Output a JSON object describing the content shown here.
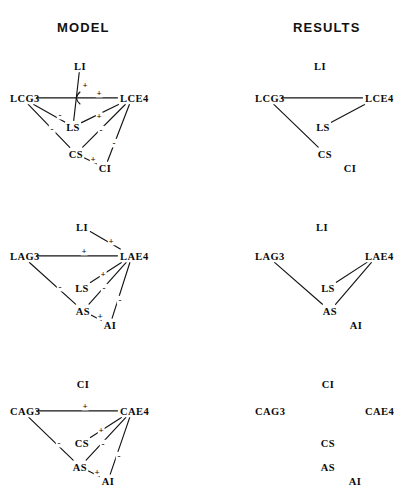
{
  "headings": {
    "left": "MODEL",
    "right": "RESULTS"
  },
  "style": {
    "line_color": "#141414",
    "text_color": "#0b0b0b",
    "background": "#ffffff"
  },
  "chart_data": {
    "type": "diagram",
    "subtype": "signed-digraph-panels",
    "title": "MODEL",
    "title2": "RESULTS",
    "columns": [
      "MODEL",
      "RESULTS"
    ],
    "rows": [
      "row-1-LC",
      "row-2-LA",
      "row-3-CA"
    ],
    "panels": [
      {
        "id": "model-row1",
        "column": "MODEL",
        "row": 1,
        "nodes": [
          {
            "id": "LI",
            "label": "LI",
            "x": 80,
            "y": 70,
            "anchor": "middle"
          },
          {
            "id": "LCG3",
            "label": "LCG3",
            "x": 10,
            "y": 102,
            "anchor": "start"
          },
          {
            "id": "LCE4",
            "label": "LCE4",
            "x": 120,
            "y": 102,
            "anchor": "start"
          },
          {
            "id": "LS",
            "label": "LS",
            "x": 73,
            "y": 131,
            "anchor": "middle"
          },
          {
            "id": "CS",
            "label": "CS",
            "x": 76,
            "y": 158,
            "anchor": "middle"
          },
          {
            "id": "CI",
            "label": "CI",
            "x": 105,
            "y": 172,
            "anchor": "middle"
          }
        ],
        "edges": [
          {
            "from": "LI",
            "to": "LS",
            "sign": "+",
            "sign_x": 85,
            "sign_y": 88
          },
          {
            "from": "LCG3",
            "to": "LCE4",
            "sign": "+",
            "sign_x": 99,
            "sign_y": 96
          },
          {
            "from": "LCG3",
            "to": "LS",
            "sign": "-",
            "sign_x": 60,
            "sign_y": 118
          },
          {
            "from": "LCG3",
            "to": "CS",
            "sign": "-",
            "sign_x": 52,
            "sign_y": 132
          },
          {
            "from": "LCE4",
            "to": "LS",
            "sign": "+",
            "sign_x": 99,
            "sign_y": 119
          },
          {
            "from": "LCE4",
            "to": "CS",
            "sign": "-",
            "sign_x": 101,
            "sign_y": 133
          },
          {
            "from": "LCE4",
            "to": "CI",
            "sign": "-",
            "sign_x": 114,
            "sign_y": 146
          },
          {
            "from": "CS",
            "to": "CI",
            "sign": "+",
            "sign_x": 93,
            "sign_y": 162
          }
        ]
      },
      {
        "id": "results-row1",
        "column": "RESULTS",
        "row": 1,
        "nodes": [
          {
            "id": "LI",
            "label": "LI",
            "x": 320,
            "y": 70,
            "anchor": "middle"
          },
          {
            "id": "LCG3",
            "label": "LCG3",
            "x": 255,
            "y": 102,
            "anchor": "start"
          },
          {
            "id": "LCE4",
            "label": "LCE4",
            "x": 365,
            "y": 102,
            "anchor": "start"
          },
          {
            "id": "LS",
            "label": "LS",
            "x": 323,
            "y": 131,
            "anchor": "middle"
          },
          {
            "id": "CS",
            "label": "CS",
            "x": 325,
            "y": 158,
            "anchor": "middle"
          },
          {
            "id": "CI",
            "label": "CI",
            "x": 350,
            "y": 172,
            "anchor": "middle"
          }
        ],
        "edges": [
          {
            "from": "LCG3",
            "to": "LCE4",
            "sign": ""
          },
          {
            "from": "LCG3",
            "to": "CS",
            "sign": ""
          },
          {
            "from": "LCE4",
            "to": "LS",
            "sign": ""
          }
        ]
      },
      {
        "id": "model-row2",
        "column": "MODEL",
        "row": 2,
        "nodes": [
          {
            "id": "LI",
            "label": "LI",
            "x": 82,
            "y": 231,
            "anchor": "middle"
          },
          {
            "id": "LAG3",
            "label": "LAG3",
            "x": 10,
            "y": 260,
            "anchor": "start"
          },
          {
            "id": "LAE4",
            "label": "LAE4",
            "x": 120,
            "y": 260,
            "anchor": "start"
          },
          {
            "id": "LS",
            "label": "LS",
            "x": 82,
            "y": 292,
            "anchor": "middle"
          },
          {
            "id": "AS",
            "label": "AS",
            "x": 83,
            "y": 315,
            "anchor": "middle"
          },
          {
            "id": "AI",
            "label": "AI",
            "x": 110,
            "y": 329,
            "anchor": "middle"
          }
        ],
        "edges": [
          {
            "from": "LI",
            "to": "LAE4",
            "sign": "+",
            "sign_x": 111,
            "sign_y": 244
          },
          {
            "from": "LAG3",
            "to": "LAE4",
            "sign": "+",
            "sign_x": 84,
            "sign_y": 254
          },
          {
            "from": "LAG3",
            "to": "AS",
            "sign": "-",
            "sign_x": 60,
            "sign_y": 290
          },
          {
            "from": "LAE4",
            "to": "LS",
            "sign": "+",
            "sign_x": 103,
            "sign_y": 277
          },
          {
            "from": "LAE4",
            "to": "AS",
            "sign": "-",
            "sign_x": 104,
            "sign_y": 291
          },
          {
            "from": "LAE4",
            "to": "AI",
            "sign": "-",
            "sign_x": 120,
            "sign_y": 303
          },
          {
            "from": "AS",
            "to": "AI",
            "sign": "+",
            "sign_x": 100,
            "sign_y": 319
          }
        ]
      },
      {
        "id": "results-row2",
        "column": "RESULTS",
        "row": 2,
        "nodes": [
          {
            "id": "LI",
            "label": "LI",
            "x": 322,
            "y": 231,
            "anchor": "middle"
          },
          {
            "id": "LAG3",
            "label": "LAG3",
            "x": 255,
            "y": 260,
            "anchor": "start"
          },
          {
            "id": "LAE4",
            "label": "LAE4",
            "x": 365,
            "y": 260,
            "anchor": "start"
          },
          {
            "id": "LS",
            "label": "LS",
            "x": 328,
            "y": 292,
            "anchor": "middle"
          },
          {
            "id": "AS",
            "label": "AS",
            "x": 330,
            "y": 315,
            "anchor": "middle"
          },
          {
            "id": "AI",
            "label": "AI",
            "x": 356,
            "y": 329,
            "anchor": "middle"
          }
        ],
        "edges": [
          {
            "from": "LAG3",
            "to": "AS",
            "sign": ""
          },
          {
            "from": "LAE4",
            "to": "LS",
            "sign": ""
          },
          {
            "from": "LAE4",
            "to": "AS",
            "sign": ""
          }
        ]
      },
      {
        "id": "model-row3",
        "column": "MODEL",
        "row": 3,
        "nodes": [
          {
            "id": "CI",
            "label": "CI",
            "x": 83,
            "y": 388,
            "anchor": "middle"
          },
          {
            "id": "CAG3",
            "label": "CAG3",
            "x": 10,
            "y": 415,
            "anchor": "start"
          },
          {
            "id": "CAE4",
            "label": "CAE4",
            "x": 120,
            "y": 415,
            "anchor": "start"
          },
          {
            "id": "CS",
            "label": "CS",
            "x": 82,
            "y": 447,
            "anchor": "middle"
          },
          {
            "id": "AS",
            "label": "AS",
            "x": 80,
            "y": 471,
            "anchor": "middle"
          },
          {
            "id": "AI",
            "label": "AI",
            "x": 108,
            "y": 485,
            "anchor": "middle"
          }
        ],
        "edges": [
          {
            "from": "CAG3",
            "to": "CAE4",
            "sign": "+",
            "sign_x": 85,
            "sign_y": 409
          },
          {
            "from": "CAG3",
            "to": "AS",
            "sign": "-",
            "sign_x": 59,
            "sign_y": 446
          },
          {
            "from": "CAE4",
            "to": "CS",
            "sign": "+",
            "sign_x": 101,
            "sign_y": 433
          },
          {
            "from": "CAE4",
            "to": "AS",
            "sign": "-",
            "sign_x": 103,
            "sign_y": 447
          },
          {
            "from": "CAE4",
            "to": "AI",
            "sign": "-",
            "sign_x": 119,
            "sign_y": 459
          },
          {
            "from": "AS",
            "to": "AI",
            "sign": "+",
            "sign_x": 97,
            "sign_y": 475
          }
        ]
      },
      {
        "id": "results-row3",
        "column": "RESULTS",
        "row": 3,
        "nodes": [
          {
            "id": "CI",
            "label": "CI",
            "x": 328,
            "y": 388,
            "anchor": "middle"
          },
          {
            "id": "CAG3",
            "label": "CAG3",
            "x": 255,
            "y": 415,
            "anchor": "start"
          },
          {
            "id": "CAE4",
            "label": "CAE4",
            "x": 365,
            "y": 415,
            "anchor": "start"
          },
          {
            "id": "CS",
            "label": "CS",
            "x": 328,
            "y": 447,
            "anchor": "middle"
          },
          {
            "id": "AS",
            "label": "AS",
            "x": 328,
            "y": 471,
            "anchor": "middle"
          },
          {
            "id": "AI",
            "label": "AI",
            "x": 355,
            "y": 485,
            "anchor": "middle"
          }
        ],
        "edges": []
      }
    ]
  }
}
